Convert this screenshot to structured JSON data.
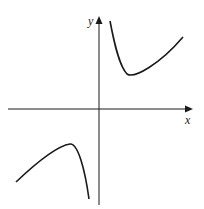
{
  "figure": {
    "type": "function-graph",
    "axes": {
      "x_label": "x",
      "y_label": "y",
      "color": "#1a1a1a"
    },
    "curve_color": "#1a1a1a",
    "branches": [
      {
        "name": "upper-right-branch",
        "feature": "local minimum",
        "points": [
          [
            110,
            21
          ],
          [
            113,
            35
          ],
          [
            117,
            50
          ],
          [
            121,
            63
          ],
          [
            124,
            70
          ],
          [
            127,
            74
          ],
          [
            132,
            74
          ],
          [
            142,
            70
          ],
          [
            155,
            63
          ],
          [
            168,
            53
          ],
          [
            183,
            37
          ]
        ]
      },
      {
        "name": "lower-left-branch",
        "feature": "local maximum",
        "points": [
          [
            16,
            182
          ],
          [
            26,
            172
          ],
          [
            38,
            162
          ],
          [
            50,
            154
          ],
          [
            62,
            147
          ],
          [
            70,
            144
          ],
          [
            74,
            146
          ],
          [
            79,
            157
          ],
          [
            84,
            175
          ],
          [
            89,
            199
          ]
        ]
      }
    ]
  }
}
